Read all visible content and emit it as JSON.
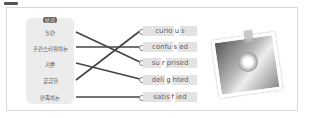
{
  "exercise": {
    "badge_label": "보기",
    "korean_words": [
      "놀란",
      "혼란스러워하는",
      "기쁜",
      "궁금한",
      "만족하는"
    ],
    "english_words": [
      {
        "before": "curio",
        "blank": "u",
        "after": "s"
      },
      {
        "before": "confu",
        "blank": "s",
        "after": "ed"
      },
      {
        "before": "su",
        "blank": "r",
        "after": "prised"
      },
      {
        "before": "deli",
        "blank": "g",
        "after": "hted"
      },
      {
        "before": "satis",
        "blank": "f",
        "after": "ied"
      }
    ],
    "matches": [
      {
        "from": "놀란",
        "to": "surprised"
      },
      {
        "from": "혼란스러워하는",
        "to": "confused"
      },
      {
        "from": "기쁜",
        "to": "delighted"
      },
      {
        "from": "궁금한",
        "to": "curious"
      },
      {
        "from": "만족하는",
        "to": "satisfied"
      }
    ],
    "photo_description": "hand holding flowers photo"
  }
}
